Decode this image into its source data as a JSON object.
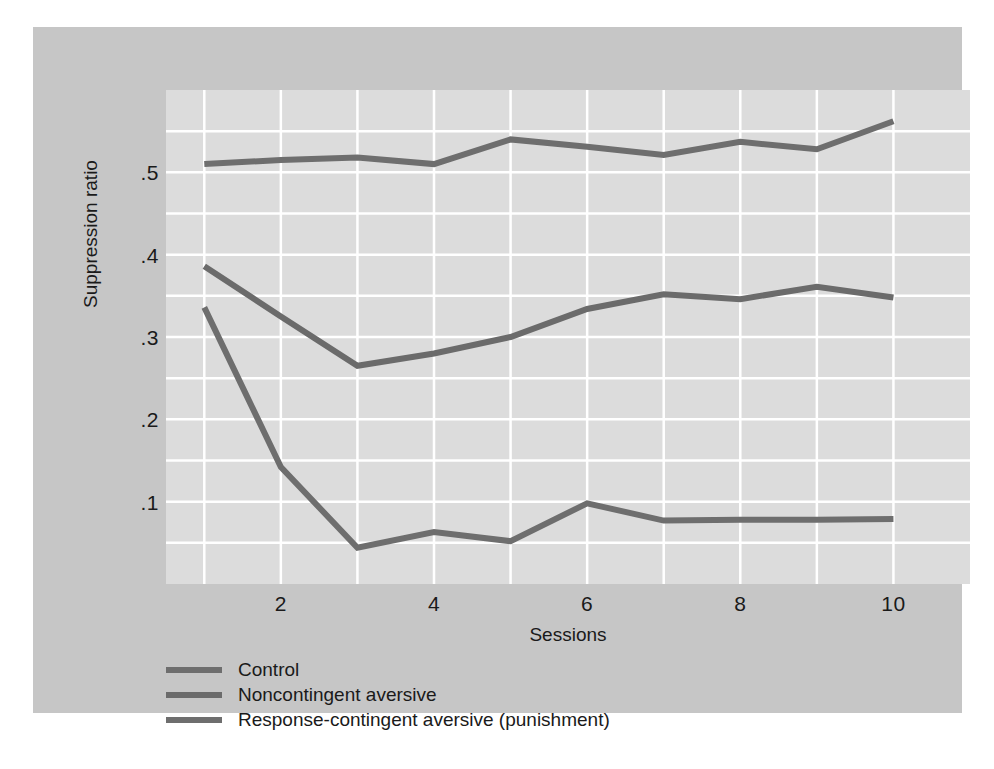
{
  "chart_data": {
    "type": "line",
    "title": "",
    "xlabel": "Sessions",
    "ylabel": "Suppression ratio",
    "x": [
      1,
      2,
      3,
      4,
      5,
      6,
      7,
      8,
      9,
      10
    ],
    "xlim": [
      0.5,
      11.0
    ],
    "ylim": [
      0.0,
      0.6
    ],
    "xticks": [
      2,
      4,
      6,
      8,
      10
    ],
    "xtick_labels": [
      "2",
      "4",
      "6",
      "8",
      "10"
    ],
    "yticks": [
      0.1,
      0.2,
      0.3,
      0.4,
      0.5
    ],
    "ytick_labels": [
      ".1",
      ".2",
      ".3",
      ".4",
      ".5"
    ],
    "grid": true,
    "grid_color": "#ffffff",
    "grid_y_step": 0.05,
    "grid_x_step": 1,
    "legend_position": "below-left",
    "series": [
      {
        "name": "Control",
        "color": "#6e6e6e",
        "values": [
          0.51,
          0.515,
          0.518,
          0.51,
          0.54,
          0.531,
          0.521,
          0.537,
          0.528,
          0.562
        ]
      },
      {
        "name": "Noncontingent aversive",
        "color": "#6b6b6b",
        "values": [
          0.386,
          0.325,
          0.265,
          0.28,
          0.3,
          0.334,
          0.352,
          0.346,
          0.361,
          0.348
        ]
      },
      {
        "name": "Response-contingent aversive (punishment)",
        "color": "#6e6e6e",
        "values": [
          0.336,
          0.142,
          0.044,
          0.063,
          0.052,
          0.098,
          0.077,
          0.078,
          0.078,
          0.079
        ]
      }
    ]
  },
  "axes": {
    "y_title": "Suppression ratio",
    "x_title": "Sessions"
  },
  "colors": {
    "page_background": "#ffffff",
    "card_background": "#c6c6c6",
    "panel_background": "#dcdcdc",
    "gridline": "#ffffff",
    "line_gray": "#6e6e6e",
    "text": "#1a1a1a"
  }
}
